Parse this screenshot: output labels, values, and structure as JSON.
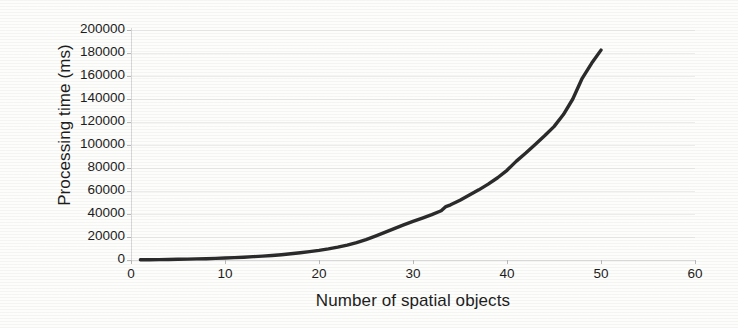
{
  "chart_data": {
    "type": "line",
    "title": "",
    "xlabel": "Number of spatial objects",
    "ylabel": "Processing time (ms)",
    "xlim": [
      0,
      60
    ],
    "ylim": [
      0,
      200000
    ],
    "xticks": [
      0,
      10,
      20,
      30,
      40,
      50,
      60
    ],
    "yticks": [
      0,
      20000,
      40000,
      60000,
      80000,
      100000,
      120000,
      140000,
      160000,
      180000,
      200000
    ],
    "xtick_labels": [
      "0",
      "10",
      "20",
      "30",
      "40",
      "50",
      "60"
    ],
    "ytick_labels": [
      "0",
      "20000",
      "40000",
      "60000",
      "80000",
      "100000",
      "120000",
      "140000",
      "160000",
      "180000",
      "200000"
    ],
    "grid": "horizontal",
    "legend": "none",
    "line_color": "#2b2b2b",
    "line_width": 3.4,
    "background_color": "#fdfdfc",
    "series": [
      {
        "name": "Processing time",
        "x": [
          1,
          2,
          3,
          4,
          5,
          6,
          7,
          8,
          9,
          10,
          11,
          12,
          13,
          14,
          15,
          16,
          17,
          18,
          19,
          20,
          21,
          22,
          23,
          24,
          25,
          26,
          27,
          28,
          29,
          30,
          31,
          32,
          33,
          33.5,
          34,
          35,
          36,
          37,
          38,
          39,
          40,
          41,
          42,
          43,
          44,
          45,
          46,
          47,
          48,
          49,
          50
        ],
        "values": [
          200,
          280,
          360,
          460,
          600,
          760,
          950,
          1150,
          1400,
          1700,
          2050,
          2450,
          2900,
          3400,
          3950,
          4600,
          5400,
          6300,
          7300,
          8400,
          9700,
          11200,
          13000,
          15200,
          17800,
          20800,
          24000,
          27300,
          30500,
          33500,
          36500,
          39500,
          42800,
          46500,
          48000,
          52000,
          56500,
          61000,
          66000,
          71500,
          78000,
          86000,
          93000,
          100500,
          108000,
          116000,
          126500,
          140000,
          158000,
          171000,
          182500
        ]
      }
    ]
  },
  "axis": {
    "y_title": "Processing time (ms)",
    "x_title": "Number of spatial objects"
  }
}
